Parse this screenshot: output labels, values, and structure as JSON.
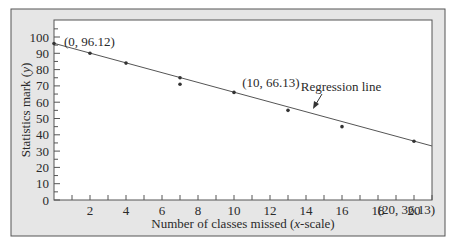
{
  "chart_data": {
    "type": "scatter",
    "title": "",
    "xlabel": "Number of classes missed (x-scale)",
    "xlabel_parts": [
      "Number of classes missed (",
      "x",
      "-scale)"
    ],
    "ylabel": "Statistics mark (y)",
    "ylabel_parts": [
      "Statistics mark (",
      "y",
      ")"
    ],
    "xlim": [
      0,
      21
    ],
    "ylim": [
      0,
      105
    ],
    "x_ticks_labeled": [
      2,
      4,
      6,
      8,
      10,
      12,
      14,
      16,
      18,
      20
    ],
    "y_ticks_labeled": [
      0,
      10,
      20,
      30,
      40,
      50,
      60,
      70,
      80,
      90,
      100
    ],
    "grid": false,
    "series": [
      {
        "name": "Observed marks",
        "type": "scatter",
        "points": [
          {
            "x": 0,
            "y": 96
          },
          {
            "x": 2,
            "y": 90
          },
          {
            "x": 4,
            "y": 84
          },
          {
            "x": 7,
            "y": 75
          },
          {
            "x": 7,
            "y": 71
          },
          {
            "x": 10,
            "y": 66
          },
          {
            "x": 13,
            "y": 55
          },
          {
            "x": 16,
            "y": 45
          },
          {
            "x": 20,
            "y": 36
          }
        ]
      },
      {
        "name": "Regression line",
        "type": "line",
        "x": [
          0,
          21
        ],
        "y": [
          96.12,
          33.13
        ]
      }
    ],
    "annotations": [
      {
        "text": "(0, 96.12)",
        "x": 0,
        "y": 96.12
      },
      {
        "text": "(10, 66.13)",
        "x": 10,
        "y": 66.13
      },
      {
        "text": "(20, 36.13)",
        "x": 20,
        "y": 36.13
      },
      {
        "text": "Regression line",
        "arrow_to_x": 14.7,
        "arrow_to_y": 52
      }
    ]
  },
  "colors": {
    "frame_bg": "#e6e6e6",
    "frame_border": "#555555",
    "plot_bg": "#ffffff",
    "line": "#555555",
    "point": "#333333"
  }
}
